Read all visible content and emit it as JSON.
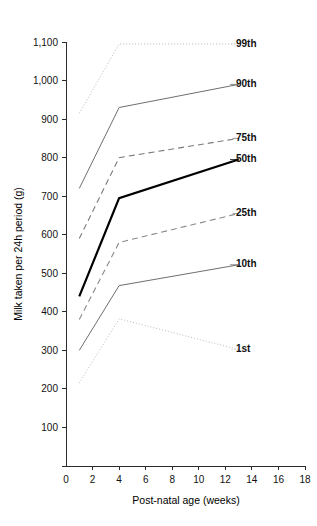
{
  "chart_data": {
    "type": "line",
    "title": "",
    "subtitle": "",
    "xlabel": "Post-natal age (weeks)",
    "ylabel": "Milk taken per 24h period (g)",
    "xlim": [
      0,
      18
    ],
    "ylim": [
      0,
      1100
    ],
    "grid": false,
    "legend_position": "right-inline-labels",
    "x_ticks": [
      0,
      2,
      4,
      6,
      8,
      10,
      12,
      14,
      16,
      18
    ],
    "x_tick_labels": [
      "0",
      "2",
      "4",
      "6",
      "8",
      "10",
      "12",
      "14",
      "16",
      "18"
    ],
    "y_ticks": [
      0,
      100,
      200,
      300,
      400,
      500,
      600,
      700,
      800,
      900,
      1000,
      1100
    ],
    "y_tick_labels": [
      "0",
      "100",
      "200",
      "300",
      "400",
      "500",
      "600",
      "700",
      "800",
      "900",
      "1,000",
      "1,100"
    ],
    "x": [
      1,
      4,
      13
    ],
    "series": [
      {
        "name": "99th",
        "label": "99th",
        "values": [
          915,
          1095,
          1095
        ],
        "style": "dotted",
        "color": "#b9b9b9",
        "width": 1.0,
        "label_y": 1095
      },
      {
        "name": "90th",
        "label": "90th",
        "values": [
          720,
          930,
          990
        ],
        "style": "solid",
        "color": "#6f6f6f",
        "width": 1.0,
        "label_y": 990
      },
      {
        "name": "75th",
        "label": "75th",
        "values": [
          590,
          800,
          850
        ],
        "style": "dashed",
        "color": "#7a7a7a",
        "width": 1.1,
        "label_y": 850
      },
      {
        "name": "50th",
        "label": "50th",
        "values": [
          440,
          695,
          795
        ],
        "style": "solid",
        "color": "#000000",
        "width": 2.2,
        "label_y": 795
      },
      {
        "name": "25th",
        "label": "25th",
        "values": [
          380,
          580,
          655
        ],
        "style": "dashed",
        "color": "#8a8a8a",
        "width": 1.1,
        "label_y": 655
      },
      {
        "name": "10th",
        "label": "10th",
        "values": [
          300,
          468,
          522
        ],
        "style": "solid",
        "color": "#6f6f6f",
        "width": 1.0,
        "label_y": 522
      },
      {
        "name": "1st",
        "label": "1st",
        "values": [
          215,
          382,
          302
        ],
        "style": "dotted",
        "color": "#bdbdbd",
        "width": 1.0,
        "label_y": 302
      }
    ]
  },
  "colors": {
    "axis": "#2b2b2b",
    "text": "#111111",
    "background": "#ffffff",
    "median_accent": "#000000"
  }
}
